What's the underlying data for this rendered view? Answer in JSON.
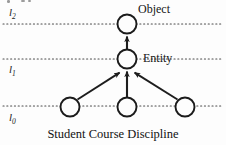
{
  "figure": {
    "kind": "concept-lattice-diagram",
    "background_color": "#fdfdfd",
    "ink_color": "#1a1a1a"
  },
  "levels": [
    {
      "id": "l2",
      "label": "l",
      "subscript": "2",
      "y": 24,
      "label_x": 9,
      "label_y": 7
    },
    {
      "id": "l1",
      "label": "l",
      "subscript": "1",
      "y": 59,
      "label_x": 9,
      "label_y": 64
    },
    {
      "id": "l0",
      "label": "l",
      "subscript": "0",
      "y": 106,
      "label_x": 9,
      "label_y": 112
    }
  ],
  "nodes": [
    {
      "id": "object",
      "cx": 127,
      "cy": 24,
      "r": 9.5,
      "level": "l2"
    },
    {
      "id": "entity",
      "cx": 127,
      "cy": 59,
      "r": 9.5,
      "level": "l1"
    },
    {
      "id": "student",
      "cx": 70,
      "cy": 107,
      "r": 9.5,
      "level": "l0"
    },
    {
      "id": "course",
      "cx": 127,
      "cy": 107,
      "r": 9.5,
      "level": "l0"
    },
    {
      "id": "discipline",
      "cx": 185,
      "cy": 107,
      "r": 9.5,
      "level": "l0"
    }
  ],
  "node_labels": [
    {
      "id": "object-label",
      "text": "Object",
      "x": 138,
      "y": 3
    },
    {
      "id": "entity-label",
      "text": "Entity",
      "x": 143,
      "y": 52
    }
  ],
  "edges": [
    {
      "id": "entity-to-object",
      "from": "entity",
      "to": "object"
    },
    {
      "id": "student-to-entity",
      "from": "student",
      "to": "entity"
    },
    {
      "id": "course-to-entity",
      "from": "course",
      "to": "entity"
    },
    {
      "id": "discipline-to-entity",
      "from": "discipline",
      "to": "entity"
    }
  ],
  "caption": {
    "text": "Student Course Discipline",
    "y": 128
  },
  "colors": {
    "line": "#1d1d1d",
    "dotted": "#4a4a4a",
    "text": "#141414",
    "smudge": "#9a9a9a"
  }
}
